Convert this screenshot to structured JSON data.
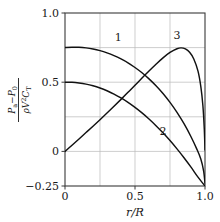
{
  "chart_data": {
    "type": "line",
    "title": "",
    "xlabel": "r/R",
    "ylabel_numerator": "P_a - P_0",
    "ylabel_denominator": "rho V^2 C_T",
    "xlim": [
      0,
      1.0
    ],
    "ylim": [
      -0.25,
      1.0
    ],
    "grid": true,
    "legend_position": "inline-labels",
    "x_ticks": [
      {
        "value": 0,
        "label": "0"
      },
      {
        "value": 0.5,
        "label": "0.5"
      },
      {
        "value": 1.0,
        "label": "1.0"
      }
    ],
    "x_minor_gridlines": [
      0.25,
      0.5,
      0.75
    ],
    "y_ticks": [
      {
        "value": 1.0,
        "label": "1.0"
      },
      {
        "value": 0.5,
        "label": "0.5"
      },
      {
        "value": 0,
        "label": "0"
      },
      {
        "value": -0.25,
        "label": "-0.25"
      }
    ],
    "y_minor_gridlines": [
      0.75,
      0.5,
      0.25,
      0
    ],
    "series": [
      {
        "name": "1",
        "label": "1",
        "label_x": 0.38,
        "label_y": 0.8,
        "points": [
          [
            0.0,
            0.75
          ],
          [
            0.05,
            0.752
          ],
          [
            0.1,
            0.752
          ],
          [
            0.15,
            0.748
          ],
          [
            0.2,
            0.74
          ],
          [
            0.25,
            0.728
          ],
          [
            0.3,
            0.712
          ],
          [
            0.35,
            0.692
          ],
          [
            0.4,
            0.668
          ],
          [
            0.45,
            0.64
          ],
          [
            0.5,
            0.606
          ],
          [
            0.55,
            0.568
          ],
          [
            0.6,
            0.524
          ],
          [
            0.65,
            0.474
          ],
          [
            0.7,
            0.418
          ],
          [
            0.75,
            0.354
          ],
          [
            0.8,
            0.282
          ],
          [
            0.85,
            0.2
          ],
          [
            0.9,
            0.106
          ],
          [
            0.94,
            0.02
          ],
          [
            0.97,
            -0.055
          ],
          [
            0.99,
            -0.14
          ],
          [
            1.0,
            -0.23
          ]
        ]
      },
      {
        "name": "2",
        "label": "2",
        "label_x": 0.7,
        "label_y": 0.12,
        "points": [
          [
            0.0,
            0.5
          ],
          [
            0.05,
            0.499
          ],
          [
            0.1,
            0.494
          ],
          [
            0.15,
            0.486
          ],
          [
            0.2,
            0.474
          ],
          [
            0.25,
            0.458
          ],
          [
            0.3,
            0.438
          ],
          [
            0.35,
            0.414
          ],
          [
            0.4,
            0.386
          ],
          [
            0.45,
            0.354
          ],
          [
            0.5,
            0.318
          ],
          [
            0.55,
            0.278
          ],
          [
            0.6,
            0.234
          ],
          [
            0.65,
            0.186
          ],
          [
            0.7,
            0.134
          ],
          [
            0.75,
            0.078
          ],
          [
            0.8,
            0.018
          ],
          [
            0.85,
            -0.046
          ],
          [
            0.9,
            -0.114
          ],
          [
            0.95,
            -0.186
          ],
          [
            1.0,
            -0.25
          ]
        ]
      },
      {
        "name": "3",
        "label": "3",
        "label_x": 0.8,
        "label_y": 0.81,
        "points": [
          [
            0.0,
            0.0
          ],
          [
            0.05,
            0.045
          ],
          [
            0.1,
            0.09
          ],
          [
            0.15,
            0.136
          ],
          [
            0.2,
            0.182
          ],
          [
            0.25,
            0.229
          ],
          [
            0.3,
            0.277
          ],
          [
            0.35,
            0.326
          ],
          [
            0.4,
            0.376
          ],
          [
            0.45,
            0.427
          ],
          [
            0.5,
            0.478
          ],
          [
            0.55,
            0.53
          ],
          [
            0.6,
            0.581
          ],
          [
            0.65,
            0.63
          ],
          [
            0.7,
            0.676
          ],
          [
            0.75,
            0.715
          ],
          [
            0.8,
            0.742
          ],
          [
            0.83,
            0.748
          ],
          [
            0.86,
            0.74
          ],
          [
            0.89,
            0.716
          ],
          [
            0.92,
            0.668
          ],
          [
            0.95,
            0.58
          ],
          [
            0.97,
            0.47
          ],
          [
            0.985,
            0.33
          ],
          [
            0.995,
            0.16
          ],
          [
            1.0,
            0.01
          ]
        ]
      }
    ]
  },
  "axis": {
    "x_title": "r/R",
    "y_numerator_main": "P",
    "y_numerator_sub1": "a",
    "y_numerator_minus": "−",
    "y_numerator_main2": "P",
    "y_numerator_sub2": "0",
    "y_denominator_rho": "ρ",
    "y_denominator_v": "V",
    "y_denominator_vsup": "2",
    "y_denominator_c": "C",
    "y_denominator_csub": "T"
  },
  "style": {
    "curve_color": "#111111",
    "grid_color": "#b9b9b9",
    "frame_color": "#3a3a3a",
    "background": "#ffffff"
  }
}
